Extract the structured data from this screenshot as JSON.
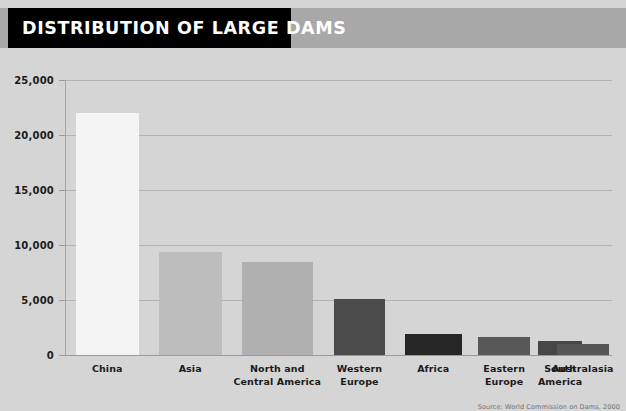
{
  "header": {
    "title": "DISTRIBUTION OF LARGE DAMS",
    "band_color": "#a8a8a8",
    "title_block_color": "#000000",
    "title_text_color": "#ffffff"
  },
  "footer": {
    "source": "Source: World Commission on Dams, 2000"
  },
  "background_color": "#d5d5d5",
  "chart_data": {
    "type": "bar",
    "title": "DISTRIBUTION OF LARGE DAMS",
    "xlabel": "",
    "ylabel": "",
    "ylim": [
      0,
      25000
    ],
    "yticks": [
      0,
      5000,
      10000,
      15000,
      20000,
      25000
    ],
    "ytick_labels": [
      "0",
      "5,000",
      "10,000",
      "15,000",
      "20,000",
      "25,000"
    ],
    "grid": true,
    "legend": "none",
    "categories": [
      "China",
      "Asia",
      "North and Central America",
      "Western Europe",
      "Africa",
      "Eastern Europe",
      "South America",
      "Australasia"
    ],
    "category_label_lines": [
      [
        "China"
      ],
      [
        "Asia"
      ],
      [
        "North and",
        "Central America"
      ],
      [
        "Western",
        "Europe"
      ],
      [
        "Africa"
      ],
      [
        "Eastern",
        "Europe"
      ],
      [
        "South",
        "America"
      ],
      [
        "Australasia"
      ]
    ],
    "values": [
      22000,
      9400,
      8500,
      5100,
      1900,
      1600,
      1300,
      1000
    ],
    "bar_colors": [
      "#f4f4f4",
      "#bdbdbd",
      "#b0b0b0",
      "#4b4b4b",
      "#262626",
      "#585858",
      "#464646",
      "#565656"
    ],
    "bar_geometry": [
      {
        "left_pct": 1.8,
        "width_pct": 11.5
      },
      {
        "left_pct": 17.0,
        "width_pct": 11.5
      },
      {
        "left_pct": 32.2,
        "width_pct": 13.0
      },
      {
        "left_pct": 49.0,
        "width_pct": 9.5
      },
      {
        "left_pct": 62.0,
        "width_pct": 10.5
      },
      {
        "left_pct": 75.5,
        "width_pct": 9.5
      },
      {
        "left_pct": 86.5,
        "width_pct": 8.0
      },
      {
        "left_pct": 97.2,
        "width_pct": 0.0
      }
    ]
  }
}
